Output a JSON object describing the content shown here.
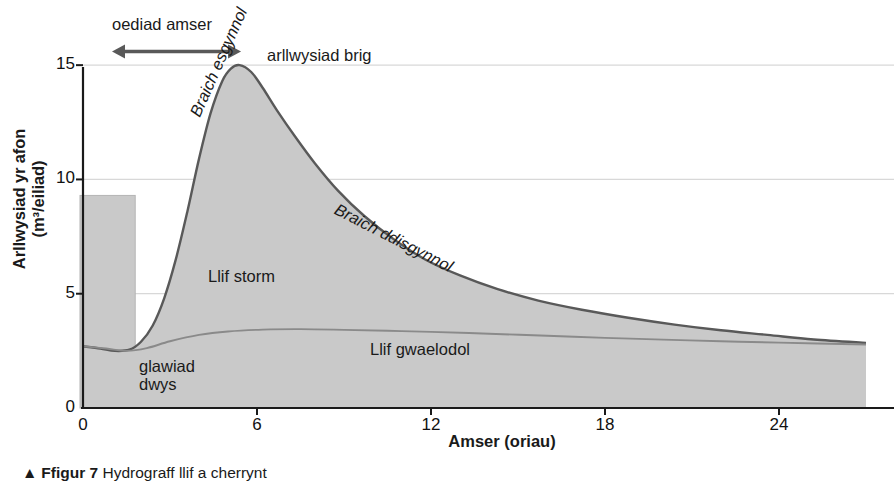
{
  "figure": {
    "axis_titles": {
      "y_line1": "Arllwysiad yr afon",
      "y_line2": "(m³/eiliad)",
      "x": "Amser (oriau)"
    },
    "caption": {
      "marker": "▲",
      "label": "Ffigur 7",
      "text": "Hydrograff llif a cherrynt"
    }
  },
  "chart_data": {
    "type": "area",
    "title": "",
    "xlabel": "Amser (oriau)",
    "ylabel": "Arllwysiad yr afon (m³/eiliad)",
    "xlim": [
      0,
      27
    ],
    "ylim": [
      0,
      16.1
    ],
    "xticks": [
      0,
      6,
      12,
      18,
      24
    ],
    "yticks": [
      0,
      5,
      10,
      15
    ],
    "grid": "horizontal",
    "colors": {
      "fill": "#c9c9c9",
      "line": "#595959",
      "baseflow_line": "#8a8a8a",
      "gridline": "#d8d8d8",
      "axis": "#1a1a1a",
      "rain_bar": "#c9c9c9",
      "rain_bar_edge": "#b4b4b4",
      "arrow": "#595959"
    },
    "series": [
      {
        "name": "Arllwysiad yr afon (hydrograff)",
        "kind": "line_area",
        "x": [
          0.0,
          0.6,
          1.1,
          1.6,
          2.0,
          2.4,
          2.8,
          3.2,
          3.6,
          4.0,
          4.4,
          4.8,
          5.1,
          5.4,
          5.8,
          6.2,
          6.7,
          7.3,
          8.0,
          8.8,
          9.7,
          10.7,
          11.8,
          13.0,
          14.3,
          15.7,
          17.2,
          18.8,
          20.4,
          22.0,
          23.6,
          25.2,
          27.0
        ],
        "y": [
          2.7,
          2.6,
          2.5,
          2.55,
          2.9,
          3.6,
          4.8,
          6.5,
          8.6,
          10.9,
          12.9,
          14.3,
          14.85,
          15.0,
          14.7,
          14.0,
          13.0,
          11.9,
          10.7,
          9.5,
          8.4,
          7.4,
          6.5,
          5.8,
          5.2,
          4.7,
          4.3,
          3.95,
          3.65,
          3.4,
          3.2,
          3.0,
          2.85
        ]
      },
      {
        "name": "Llif gwaelodol",
        "kind": "line",
        "x": [
          0.0,
          0.8,
          1.5,
          2.2,
          3.0,
          4.0,
          5.0,
          6.2,
          7.5,
          9.0,
          10.5,
          12.0,
          14.0,
          16.0,
          18.0,
          20.0,
          22.0,
          24.0,
          27.0
        ],
        "y": [
          2.7,
          2.6,
          2.5,
          2.62,
          2.92,
          3.2,
          3.35,
          3.43,
          3.45,
          3.42,
          3.38,
          3.33,
          3.25,
          3.16,
          3.07,
          2.99,
          2.92,
          2.86,
          2.78
        ]
      }
    ],
    "rain_bar": {
      "name": "glawiad dwys",
      "x_start": 0.0,
      "x_end": 1.8,
      "height": 9.3,
      "x_start_px_offset": -3
    },
    "annotations": [
      {
        "id": "lag",
        "text": "oediad amser",
        "type": "label"
      },
      {
        "id": "lag_arrow",
        "type": "double-arrow",
        "x_from": 1.0,
        "x_to": 5.45,
        "y": 15.6
      },
      {
        "id": "peak",
        "text": "arllwysiad brig",
        "type": "label"
      },
      {
        "id": "rising",
        "text": "Braich esgynnol",
        "type": "label",
        "style": "italic",
        "rotation": -66
      },
      {
        "id": "falling",
        "text": "Braich ddisgynnol",
        "type": "label",
        "style": "italic",
        "rotation": 27
      },
      {
        "id": "stormflow",
        "text": "Llif storm",
        "type": "label"
      },
      {
        "id": "baseflow",
        "text": "Llif gwaelodol",
        "type": "label"
      },
      {
        "id": "rain1",
        "text": "glawiad",
        "type": "label"
      },
      {
        "id": "rain2",
        "text": "dwys",
        "type": "label"
      }
    ]
  }
}
